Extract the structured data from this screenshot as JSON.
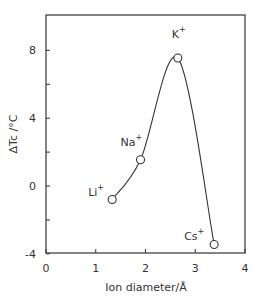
{
  "chart_data": {
    "type": "line",
    "title": "",
    "xlabel": "Ion diameter / Å",
    "ylabel": "ΔTc / °C",
    "xlim": [
      0,
      4
    ],
    "ylim": [
      -4,
      10
    ],
    "xticks": [
      0,
      1,
      2,
      3,
      4
    ],
    "yticks_labeled": [
      -4,
      0,
      4,
      8
    ],
    "yticks_minor": [
      -2,
      2,
      6
    ],
    "grid": false,
    "legend": null,
    "series": [
      {
        "name": "ΔTc vs ion diameter",
        "marker": "open-circle",
        "smooth": true,
        "points": [
          {
            "label": "Li+",
            "x": 1.33,
            "y": -0.8
          },
          {
            "label": "Na+",
            "x": 1.9,
            "y": 1.55
          },
          {
            "label": "K+",
            "x": 2.65,
            "y": 7.55
          },
          {
            "label": "Cs+",
            "x": 3.38,
            "y": -3.45
          }
        ]
      }
    ]
  },
  "labels": {
    "xlabel_main": "Ion diameter",
    "xlabel_sep": "/",
    "xlabel_unit": "Å",
    "ylabel": "ΔTc /°C"
  }
}
